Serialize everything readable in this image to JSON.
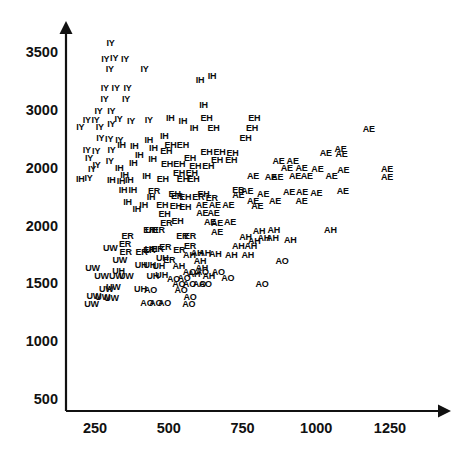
{
  "chart_data": {
    "type": "scatter",
    "title": "",
    "xlabel": "",
    "ylabel": "",
    "xlim": [
      120,
      1340
    ],
    "ylim": [
      430,
      3700
    ],
    "grid": false,
    "legend": "none",
    "marker_style": "text-label",
    "xticks": [
      "250",
      "500",
      "750",
      "1000",
      "1250"
    ],
    "xtick_values": [
      250,
      500,
      750,
      1000,
      1250
    ],
    "yticks": [
      "3500",
      "3000",
      "2000",
      "2000",
      "1500",
      "1000",
      "500"
    ],
    "ytick_values": [
      3500,
      3000,
      2500,
      2000,
      1500,
      1000,
      500
    ],
    "series": [
      {
        "name": "IY",
        "points": [
          [
            303,
            3580
          ],
          [
            285,
            3440
          ],
          [
            315,
            3450
          ],
          [
            352,
            3440
          ],
          [
            300,
            3350
          ],
          [
            418,
            3350
          ],
          [
            283,
            3190
          ],
          [
            320,
            3190
          ],
          [
            360,
            3190
          ],
          [
            282,
            3090
          ],
          [
            355,
            3090
          ],
          [
            262,
            2990
          ],
          [
            305,
            2990
          ],
          [
            222,
            2910
          ],
          [
            252,
            2910
          ],
          [
            330,
            2920
          ],
          [
            372,
            2905
          ],
          [
            432,
            2915
          ],
          [
            200,
            2855
          ],
          [
            266,
            2850
          ],
          [
            305,
            2880
          ],
          [
            268,
            2760
          ],
          [
            298,
            2745
          ],
          [
            332,
            2740
          ],
          [
            222,
            2650
          ],
          [
            254,
            2645
          ],
          [
            306,
            2650
          ],
          [
            230,
            2580
          ],
          [
            255,
            2520
          ],
          [
            300,
            2560
          ],
          [
            240,
            2490
          ],
          [
            228,
            2410
          ]
        ]
      },
      {
        "name": "IH",
        "points": [
          [
            606,
            3260
          ],
          [
            647,
            3290
          ],
          [
            618,
            3040
          ],
          [
            505,
            2930
          ],
          [
            548,
            2900
          ],
          [
            586,
            2845
          ],
          [
            485,
            2775
          ],
          [
            432,
            2740
          ],
          [
            340,
            2695
          ],
          [
            383,
            2685
          ],
          [
            448,
            2670
          ],
          [
            400,
            2610
          ],
          [
            445,
            2575
          ],
          [
            380,
            2540
          ],
          [
            332,
            2495
          ],
          [
            350,
            2440
          ],
          [
            425,
            2430
          ],
          [
            200,
            2400
          ],
          [
            305,
            2390
          ],
          [
            338,
            2385
          ],
          [
            366,
            2390
          ],
          [
            345,
            2310
          ],
          [
            378,
            2305
          ],
          [
            440,
            2245
          ],
          [
            360,
            2200
          ],
          [
            415,
            2180
          ],
          [
            392,
            2145
          ]
        ]
      },
      {
        "name": "EH",
        "points": [
          [
            628,
            2930
          ],
          [
            790,
            2930
          ],
          [
            652,
            2840
          ],
          [
            782,
            2840
          ],
          [
            760,
            2760
          ],
          [
            506,
            2700
          ],
          [
            548,
            2700
          ],
          [
            492,
            2640
          ],
          [
            628,
            2635
          ],
          [
            672,
            2635
          ],
          [
            716,
            2630
          ],
          [
            572,
            2580
          ],
          [
            664,
            2570
          ],
          [
            712,
            2565
          ],
          [
            494,
            2530
          ],
          [
            536,
            2530
          ],
          [
            590,
            2515
          ],
          [
            634,
            2515
          ],
          [
            535,
            2450
          ],
          [
            578,
            2450
          ],
          [
            480,
            2400
          ],
          [
            548,
            2400
          ],
          [
            584,
            2400
          ],
          [
            520,
            2270
          ],
          [
            556,
            2245
          ],
          [
            618,
            2270
          ],
          [
            478,
            2175
          ],
          [
            524,
            2165
          ],
          [
            556,
            2160
          ],
          [
            486,
            2100
          ],
          [
            530,
            2040
          ]
        ]
      },
      {
        "name": "AE",
        "points": [
          [
            1178,
            2835
          ],
          [
            1082,
            2665
          ],
          [
            1032,
            2630
          ],
          [
            1086,
            2620
          ],
          [
            872,
            2560
          ],
          [
            920,
            2560
          ],
          [
            900,
            2500
          ],
          [
            950,
            2495
          ],
          [
            1004,
            2490
          ],
          [
            1092,
            2480
          ],
          [
            1240,
            2490
          ],
          [
            786,
            2430
          ],
          [
            846,
            2420
          ],
          [
            868,
            2420
          ],
          [
            928,
            2425
          ],
          [
            968,
            2425
          ],
          [
            1052,
            2425
          ],
          [
            1240,
            2420
          ],
          [
            766,
            2295
          ],
          [
            736,
            2265
          ],
          [
            820,
            2275
          ],
          [
            908,
            2290
          ],
          [
            952,
            2290
          ],
          [
            1000,
            2285
          ],
          [
            1090,
            2300
          ],
          [
            786,
            2215
          ],
          [
            860,
            2215
          ],
          [
            950,
            2210
          ],
          [
            612,
            2180
          ],
          [
            656,
            2175
          ],
          [
            702,
            2175
          ],
          [
            800,
            2170
          ],
          [
            614,
            2105
          ],
          [
            652,
            2105
          ],
          [
            640,
            2030
          ],
          [
            664,
            2025
          ],
          [
            708,
            2030
          ],
          [
            664,
            1940
          ]
        ]
      },
      {
        "name": "ER",
        "points": [
          [
            450,
            2295
          ],
          [
            528,
            2255
          ],
          [
            600,
            2250
          ],
          [
            646,
            2240
          ],
          [
            736,
            2310
          ],
          [
            492,
            2020
          ],
          [
            434,
            1960
          ],
          [
            466,
            1960
          ],
          [
            360,
            1910
          ],
          [
            546,
            1905
          ],
          [
            572,
            1905
          ],
          [
            352,
            1840
          ],
          [
            354,
            1770
          ],
          [
            408,
            1775
          ],
          [
            434,
            1790
          ],
          [
            462,
            1800
          ],
          [
            488,
            1810
          ],
          [
            536,
            1790
          ],
          [
            572,
            1825
          ],
          [
            502,
            1705
          ]
        ]
      },
      {
        "name": "AH",
        "points": [
          [
            806,
            1955
          ],
          [
            856,
            1960
          ],
          [
            1048,
            1965
          ],
          [
            760,
            1900
          ],
          [
            790,
            1870
          ],
          [
            822,
            1890
          ],
          [
            852,
            1890
          ],
          [
            912,
            1875
          ],
          [
            736,
            1820
          ],
          [
            778,
            1820
          ],
          [
            570,
            1745
          ],
          [
            596,
            1760
          ],
          [
            622,
            1760
          ],
          [
            658,
            1750
          ],
          [
            712,
            1745
          ],
          [
            768,
            1745
          ],
          [
            534,
            1650
          ],
          [
            606,
            1690
          ],
          [
            612,
            1630
          ],
          [
            586,
            1580
          ],
          [
            636,
            1565
          ]
        ]
      },
      {
        "name": "UH",
        "points": [
          [
            442,
            1960
          ],
          [
            440,
            1800
          ],
          [
            478,
            1715
          ],
          [
            406,
            1660
          ],
          [
            436,
            1655
          ],
          [
            466,
            1650
          ],
          [
            330,
            1605
          ],
          [
            446,
            1565
          ],
          [
            476,
            1570
          ],
          [
            404,
            1455
          ]
        ]
      },
      {
        "name": "UW",
        "points": [
          [
            302,
            1805
          ],
          [
            334,
            1700
          ],
          [
            242,
            1630
          ],
          [
            272,
            1560
          ],
          [
            322,
            1560
          ],
          [
            356,
            1560
          ],
          [
            288,
            1450
          ],
          [
            312,
            1465
          ],
          [
            246,
            1390
          ],
          [
            276,
            1380
          ],
          [
            306,
            1370
          ],
          [
            238,
            1320
          ]
        ]
      },
      {
        "name": "AO",
        "points": [
          [
            884,
            1690
          ],
          [
            570,
            1595
          ],
          [
            614,
            1600
          ],
          [
            668,
            1600
          ],
          [
            700,
            1545
          ],
          [
            516,
            1540
          ],
          [
            552,
            1545
          ],
          [
            534,
            1490
          ],
          [
            570,
            1490
          ],
          [
            604,
            1495
          ],
          [
            624,
            1490
          ],
          [
            816,
            1490
          ],
          [
            438,
            1440
          ],
          [
            542,
            1440
          ],
          [
            572,
            1385
          ],
          [
            426,
            1330
          ],
          [
            456,
            1330
          ],
          [
            486,
            1330
          ],
          [
            568,
            1325
          ]
        ]
      }
    ]
  },
  "axes": {
    "x_axis_name": "x-axis",
    "y_axis_name": "y-axis"
  }
}
